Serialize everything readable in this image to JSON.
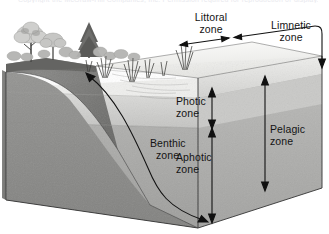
{
  "figure": {
    "caption_sliver": "Copyright  the McGraw-Hill Companies, Inc. Permission required for reproduction or display.",
    "style": "grayscale scientific illustration"
  },
  "labels": {
    "littoral": {
      "line1": "Littoral",
      "line2": "zone"
    },
    "limnetic": {
      "line1": "Limnetic",
      "line2": "zone"
    },
    "photic": {
      "line1": "Photic",
      "line2": "zone"
    },
    "aphotic": {
      "line1": "Aphotic",
      "line2": "zone"
    },
    "benthic": {
      "line1": "Benthic",
      "line2": "zone"
    },
    "pelagic": {
      "line1": "Pelagic",
      "line2": "zone"
    }
  },
  "icons": {
    "littoral_span": "double-headed-horizontal-arrow",
    "limnetic_span": "elbow-arrow-down",
    "photic_span": "double-headed-vertical-arrow",
    "aphotic_span": "double-headed-vertical-arrow",
    "pelagic_span": "double-headed-vertical-arrow",
    "benthic_pointer": "curved-arrow-both-ends",
    "shore_trees": "tree-icon",
    "emergent_plants": "reed-icon"
  },
  "colors": {
    "surface_water": "#f2f2f0",
    "photic_water": "#cfcfcd",
    "aphotic_water": "#a8a8a6",
    "sediment_front": "#8e8e8c",
    "sediment_left": "#7e7e7c",
    "shoreline_soil": "#6f6f6d",
    "outline": "#2a2a2a",
    "label_text": "#141414"
  }
}
